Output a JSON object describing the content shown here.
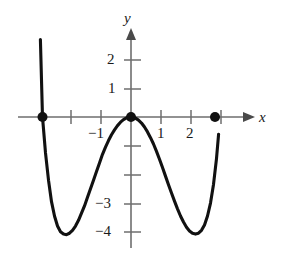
{
  "chart_data": {
    "type": "line",
    "title": "",
    "xlabel": "x",
    "ylabel": "y",
    "xlim": [
      -3.1,
      3.6
    ],
    "ylim": [
      -4.7,
      2.8
    ],
    "grid": false,
    "legend": false,
    "x_ticks": [
      {
        "value": -2,
        "label": ""
      },
      {
        "value": -1,
        "label": "−1"
      },
      {
        "value": 1,
        "label": "1"
      },
      {
        "value": 2,
        "label": "2"
      },
      {
        "value": 3,
        "label": ""
      }
    ],
    "y_ticks": [
      {
        "value": 2,
        "label": "2"
      },
      {
        "value": 1,
        "label": "1"
      },
      {
        "value": -1,
        "label": ""
      },
      {
        "value": -2,
        "label": ""
      },
      {
        "value": -3,
        "label": "−3"
      },
      {
        "value": -4,
        "label": "−4"
      }
    ],
    "marked_points": [
      {
        "x": -2.95,
        "y": 0,
        "style": "filled-dot"
      },
      {
        "x": 0,
        "y": 0,
        "style": "filled-dot"
      },
      {
        "x": 2.8,
        "y": 0,
        "style": "filled-dot"
      }
    ],
    "series": [
      {
        "name": "curve",
        "color": "#111111",
        "x": [
          -3.02,
          -2.95,
          -2.85,
          -2.75,
          -2.65,
          -2.55,
          -2.45,
          -2.35,
          -2.25,
          -2.15,
          -2.05,
          -1.95,
          -1.85,
          -1.75,
          -1.65,
          -1.55,
          -1.45,
          -1.35,
          -1.25,
          -1.15,
          -1.05,
          -0.95,
          -0.85,
          -0.75,
          -0.65,
          -0.55,
          -0.45,
          -0.35,
          -0.25,
          -0.15,
          -0.05,
          0,
          0.05,
          0.15,
          0.25,
          0.35,
          0.45,
          0.55,
          0.65,
          0.75,
          0.85,
          0.95,
          1.05,
          1.15,
          1.25,
          1.35,
          1.45,
          1.55,
          1.65,
          1.75,
          1.85,
          1.95,
          2.05,
          2.15,
          2.25,
          2.35,
          2.45,
          2.55,
          2.65,
          2.75,
          2.85,
          2.92
        ],
        "y": [
          2.7,
          0.0,
          -1.25,
          -2.2,
          -2.95,
          -3.45,
          -3.8,
          -4.0,
          -4.08,
          -4.1,
          -4.05,
          -3.95,
          -3.8,
          -3.6,
          -3.35,
          -3.1,
          -2.8,
          -2.5,
          -2.2,
          -1.9,
          -1.6,
          -1.3,
          -1.05,
          -0.82,
          -0.62,
          -0.45,
          -0.3,
          -0.18,
          -0.09,
          -0.03,
          -0.005,
          0.0,
          -0.005,
          -0.04,
          -0.11,
          -0.21,
          -0.35,
          -0.52,
          -0.72,
          -0.94,
          -1.2,
          -1.47,
          -1.76,
          -2.06,
          -2.36,
          -2.65,
          -2.93,
          -3.2,
          -3.45,
          -3.66,
          -3.84,
          -3.97,
          -4.05,
          -4.08,
          -4.05,
          -3.95,
          -3.76,
          -3.45,
          -3.0,
          -2.35,
          -1.45,
          -0.6
        ]
      }
    ]
  },
  "axis_labels": {
    "x": "x",
    "y": "y"
  }
}
